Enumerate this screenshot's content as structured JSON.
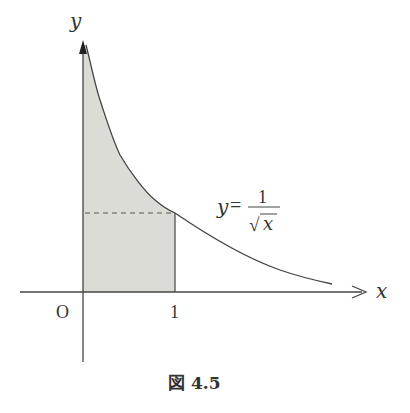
{
  "figure": {
    "caption": "図 4.5",
    "x_axis_label": "x",
    "y_axis_label": "y",
    "origin_label": "O",
    "x_tick_label": "1",
    "curve_label": {
      "lhs": "y",
      "eq": "=",
      "numerator": "1",
      "denominator": "x",
      "radical": "√"
    },
    "colors": {
      "fill": "#dcdcd6",
      "line": "#444444"
    }
  }
}
